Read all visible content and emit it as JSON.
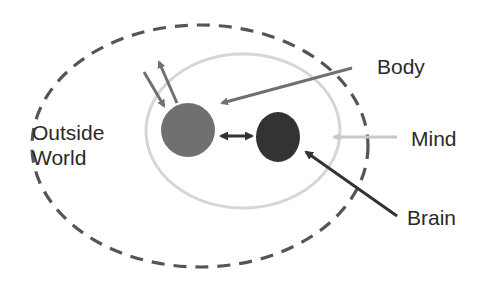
{
  "diagram": {
    "labels": {
      "outside_line1": "Outside",
      "outside_line2": "World",
      "body": "Body",
      "mind": "Mind",
      "brain": "Brain"
    },
    "colors": {
      "outside_dashed": "#555555",
      "mind_ring": "#d4d4d4",
      "body_node": "#707070",
      "brain_node": "#333333",
      "body_arrow": "#707070",
      "mind_arrow": "#c8c8c8",
      "brain_arrow": "#333333",
      "text": "#2a2a2a"
    }
  }
}
